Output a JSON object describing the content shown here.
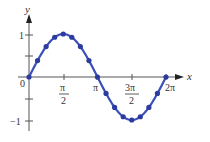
{
  "chart_data": {
    "type": "line",
    "title": "",
    "xlabel": "x",
    "ylabel": "y",
    "function": "y = sin(x)",
    "x": [
      0,
      0.3927,
      0.7854,
      1.1781,
      1.5708,
      1.9635,
      2.3562,
      2.7489,
      3.1416,
      3.5343,
      3.927,
      4.3197,
      4.7124,
      5.1051,
      5.4978,
      5.8905,
      6.2832
    ],
    "values": [
      0,
      0.383,
      0.707,
      0.924,
      1,
      0.924,
      0.707,
      0.383,
      0,
      -0.383,
      -0.707,
      -0.924,
      -1,
      -0.924,
      -0.707,
      -0.383,
      0
    ],
    "markers": true,
    "xlim": [
      0,
      6.2832
    ],
    "ylim": [
      -1,
      1
    ],
    "x_ticks": [
      "π/2",
      "π",
      "3π/2",
      "2π"
    ],
    "y_ticks": [
      "1",
      "-1"
    ],
    "origin_label": "0",
    "grid": false,
    "legend": null,
    "colors": {
      "curve": "#3a4fb8",
      "marker": "#2c3c9e",
      "axis": "#555555"
    }
  },
  "labels": {
    "y_axis": "y",
    "x_axis": "x",
    "origin": "0",
    "y_one": "1",
    "y_neg_one": "−1",
    "tick_pi_half_num": "π",
    "tick_pi_half_den": "2",
    "tick_pi": "π",
    "tick_3pi_half_num": "3π",
    "tick_3pi_half_den": "2",
    "tick_2pi": "2π"
  }
}
